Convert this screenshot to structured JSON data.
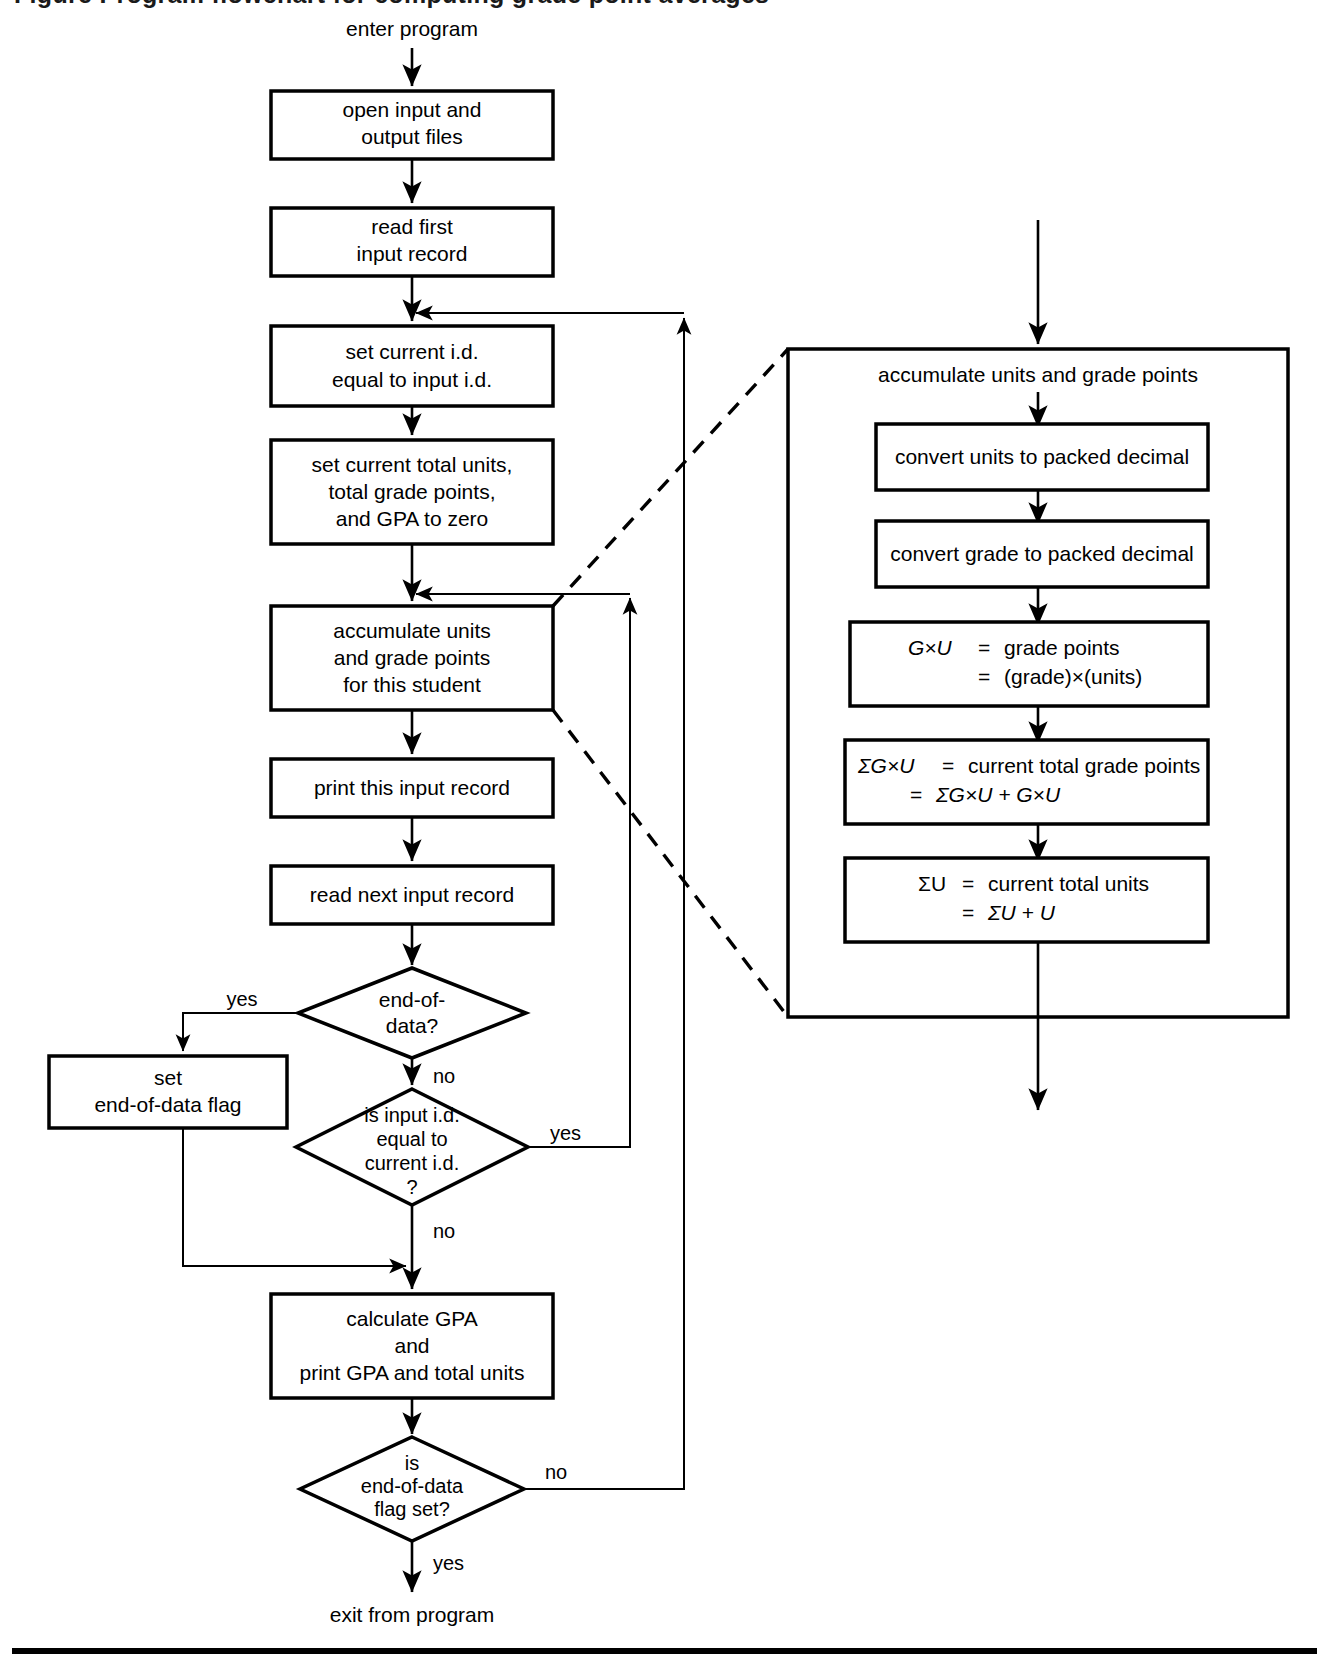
{
  "figure": {
    "type": "flowchart",
    "truncated_caption_above": "Figure caption (cropped at top edge)"
  },
  "terminators": {
    "enter": "enter program",
    "exit": "exit from program"
  },
  "main_flow": {
    "boxes": [
      {
        "id": "open-files",
        "lines": [
          "open input and",
          "output files"
        ]
      },
      {
        "id": "read-first",
        "lines": [
          "read first",
          "input record"
        ]
      },
      {
        "id": "set-current-id",
        "lines": [
          "set current i.d.",
          "equal to input i.d."
        ]
      },
      {
        "id": "zero-totals",
        "lines": [
          "set current total units,",
          "total grade points,",
          "and GPA to zero"
        ]
      },
      {
        "id": "accumulate",
        "lines": [
          "accumulate units",
          "and grade points",
          "for this student"
        ]
      },
      {
        "id": "print-record",
        "lines": [
          "print this input record"
        ]
      },
      {
        "id": "read-next",
        "lines": [
          "read next input record"
        ]
      },
      {
        "id": "set-eod-flag",
        "lines": [
          "set",
          "end-of-data flag"
        ]
      },
      {
        "id": "calc-gpa",
        "lines": [
          "calculate GPA",
          "and",
          "print GPA and total units"
        ]
      }
    ],
    "decisions": [
      {
        "id": "end-of-data",
        "lines": [
          "end-of-",
          "data?"
        ],
        "yes": "yes",
        "no": "no"
      },
      {
        "id": "id-equal",
        "lines": [
          "is input i.d.",
          "equal to",
          "current i.d.",
          "?"
        ],
        "yes": "yes",
        "no": "no"
      },
      {
        "id": "eod-flag-set",
        "lines": [
          "is",
          "end-of-data",
          "flag set?"
        ],
        "yes": "yes",
        "no": "no"
      }
    ]
  },
  "detail_panel": {
    "header": "accumulate units and grade points",
    "boxes": [
      {
        "id": "convert-units",
        "lines": [
          "convert units to packed decimal"
        ]
      },
      {
        "id": "convert-grade",
        "lines": [
          "convert grade to packed decimal"
        ]
      },
      {
        "id": "grade-points",
        "rows": [
          {
            "lhs": "G×U",
            "lhs_italic": true,
            "eq": "=",
            "rhs": "grade points"
          },
          {
            "lhs": "",
            "lhs_italic": false,
            "eq": "=",
            "rhs": "(grade)×(units)"
          }
        ]
      },
      {
        "id": "sum-grade-points",
        "rows": [
          {
            "lhs": "ΣG×U",
            "lhs_italic": true,
            "eq": "=",
            "rhs": "current total grade points"
          },
          {
            "lhs": "",
            "lhs_italic": false,
            "eq": "=",
            "rhs": "ΣG×U + G×U"
          }
        ]
      },
      {
        "id": "sum-units",
        "rows": [
          {
            "lhs": "ΣU",
            "lhs_italic": false,
            "eq": "=",
            "rhs": "current total units"
          },
          {
            "lhs": "",
            "lhs_italic": false,
            "eq": "=",
            "rhs": "ΣU + U"
          }
        ]
      }
    ]
  },
  "colors": {
    "ink": "#000000",
    "paper": "#ffffff"
  }
}
